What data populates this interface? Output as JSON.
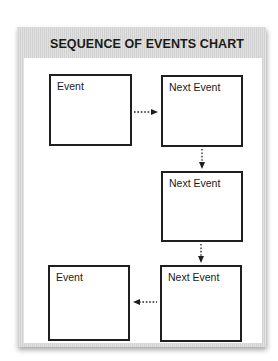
{
  "chart": {
    "title": "SEQUENCE OF EVENTS CHART",
    "boxes": [
      {
        "label": "Event"
      },
      {
        "label": "Next Event"
      },
      {
        "label": "Next Event"
      },
      {
        "label": "Next Event"
      },
      {
        "label": "Event"
      }
    ],
    "arrows": [
      {
        "from": 0,
        "to": 1,
        "direction": "right",
        "style": "dotted"
      },
      {
        "from": 1,
        "to": 2,
        "direction": "down",
        "style": "dotted"
      },
      {
        "from": 2,
        "to": 3,
        "direction": "down",
        "style": "dotted"
      },
      {
        "from": 3,
        "to": 4,
        "direction": "left",
        "style": "dotted"
      }
    ],
    "colors": {
      "frame": "#d9d9d9",
      "border": "#1f1f1f",
      "background": "#ffffff"
    }
  }
}
